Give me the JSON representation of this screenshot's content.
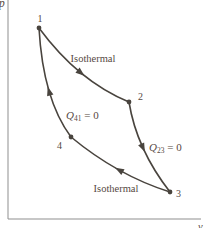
{
  "diagram": {
    "width": 213,
    "height": 228,
    "colors": {
      "background": "#ffffff",
      "axis": "#8f8f8f",
      "curve": "#49443e",
      "text": "#56493f"
    },
    "axes": {
      "y_label": "p",
      "x_label": "v",
      "origin": {
        "x": 8,
        "y": 219
      },
      "x_end": 201,
      "y_top": 0,
      "y_label_pos": {
        "x": -1,
        "y": 7,
        "size": 11.5
      },
      "x_label_pos": {
        "x": 198,
        "y": 230,
        "size": 10.5
      }
    },
    "nodes": [
      {
        "name": "state-point-1",
        "label": "1",
        "x": 39,
        "y": 28,
        "lx": 40,
        "ly": 22,
        "anchor": "middle"
      },
      {
        "name": "state-point-2",
        "label": "2",
        "x": 129,
        "y": 102,
        "lx": 138,
        "ly": 100,
        "anchor": "start"
      },
      {
        "name": "state-point-3",
        "label": "3",
        "x": 170,
        "y": 192,
        "lx": 176,
        "ly": 197,
        "anchor": "start"
      },
      {
        "name": "state-point-4",
        "label": "4",
        "x": 71,
        "y": 137,
        "lx": 62,
        "ly": 149,
        "anchor": "end"
      }
    ],
    "edges": [
      {
        "name": "process-1-2-isothermal",
        "p0": [
          39,
          28
        ],
        "c": [
          78,
          81
        ],
        "p1": [
          129,
          102
        ]
      },
      {
        "name": "process-2-3-adiabatic",
        "p0": [
          129,
          102
        ],
        "c": [
          136.5,
          149
        ],
        "p1": [
          170,
          192
        ]
      },
      {
        "name": "process-3-4-isothermal",
        "p0": [
          170,
          192
        ],
        "c": [
          117.5,
          175.5
        ],
        "p1": [
          71,
          137
        ]
      },
      {
        "name": "process-4-1-adiabatic",
        "p0": [
          71,
          137
        ],
        "c": [
          43,
          99.5
        ],
        "p1": [
          39,
          28
        ]
      }
    ],
    "labels": [
      {
        "name": "isothermal-top-label",
        "main": "Isothermal",
        "sub": "",
        "tail": "",
        "x": 93,
        "y": 62,
        "anchor": "middle",
        "italic": false,
        "size": 10.5
      },
      {
        "name": "q41-zero-label",
        "main": "Q",
        "sub": "41",
        "tail": " = 0",
        "x": 66,
        "y": 119,
        "anchor": "start",
        "italic": true,
        "size": 11
      },
      {
        "name": "q23-zero-label",
        "main": "Q",
        "sub": "23",
        "tail": " = 0",
        "x": 149,
        "y": 151,
        "anchor": "start",
        "italic": true,
        "size": 11
      },
      {
        "name": "isothermal-bottom-label",
        "main": "Isothermal",
        "sub": "",
        "tail": "",
        "x": 116,
        "y": 192,
        "anchor": "middle",
        "italic": false,
        "size": 10.5
      }
    ],
    "arrow": {
      "tip": 4.5,
      "back": -4.5,
      "halfwidth": 3.3
    },
    "node_radius": 2.4,
    "curve_width": 1.6,
    "axis_width": 1,
    "node_label_size": 10
  }
}
